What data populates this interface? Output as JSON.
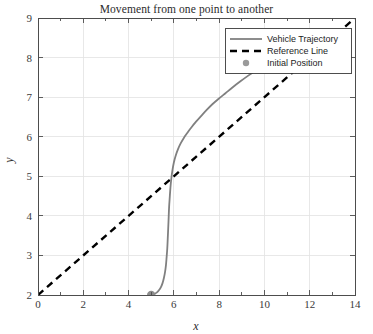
{
  "chart_data": {
    "type": "line",
    "title": "Movement from one point to another",
    "xlabel": "x",
    "ylabel": "y",
    "xlim": [
      0,
      14
    ],
    "ylim": [
      2,
      9
    ],
    "xticks": [
      0,
      2,
      4,
      6,
      8,
      10,
      12,
      14
    ],
    "xtick_labels": [
      "0",
      "2",
      "4",
      "6",
      "8",
      "10",
      "12",
      "14"
    ],
    "xminorticks": [
      1,
      3,
      5,
      7,
      9,
      11,
      13
    ],
    "yticks": [
      2,
      3,
      4,
      5,
      6,
      7,
      8,
      9
    ],
    "ytick_labels": [
      "2",
      "3",
      "4",
      "5",
      "6",
      "7",
      "8",
      "9"
    ],
    "grid": true,
    "legend_position": "top-right",
    "series": [
      {
        "name": "Vehicle Trajectory",
        "style": "solid",
        "color": "#808080",
        "points": [
          [
            5.0,
            2.0
          ],
          [
            5.12,
            2.02
          ],
          [
            5.24,
            2.06
          ],
          [
            5.34,
            2.12
          ],
          [
            5.43,
            2.2
          ],
          [
            5.5,
            2.3
          ],
          [
            5.56,
            2.43
          ],
          [
            5.61,
            2.58
          ],
          [
            5.65,
            2.75
          ],
          [
            5.68,
            2.95
          ],
          [
            5.71,
            3.18
          ],
          [
            5.73,
            3.42
          ],
          [
            5.75,
            3.68
          ],
          [
            5.77,
            3.95
          ],
          [
            5.79,
            4.22
          ],
          [
            5.82,
            4.48
          ],
          [
            5.85,
            4.72
          ],
          [
            5.89,
            4.95
          ],
          [
            5.94,
            5.16
          ],
          [
            6.0,
            5.35
          ],
          [
            6.08,
            5.52
          ],
          [
            6.18,
            5.68
          ],
          [
            6.3,
            5.83
          ],
          [
            6.44,
            5.97
          ],
          [
            6.6,
            6.1
          ],
          [
            6.78,
            6.24
          ],
          [
            6.98,
            6.38
          ],
          [
            7.2,
            6.52
          ],
          [
            7.44,
            6.67
          ],
          [
            7.7,
            6.82
          ],
          [
            7.98,
            6.96
          ],
          [
            8.28,
            7.1
          ],
          [
            8.6,
            7.25
          ],
          [
            8.94,
            7.4
          ],
          [
            9.3,
            7.55
          ],
          [
            9.68,
            7.7
          ],
          [
            10.08,
            7.86
          ],
          [
            10.5,
            8.02
          ],
          [
            10.94,
            8.19
          ],
          [
            11.4,
            8.37
          ],
          [
            11.55,
            8.43
          ]
        ]
      },
      {
        "name": "Reference Line",
        "style": "dashed",
        "color": "#000000",
        "points": [
          [
            0,
            2
          ],
          [
            14,
            9
          ]
        ]
      },
      {
        "name": "Initial Position",
        "style": "marker",
        "color": "#8c8c8c",
        "points": [
          [
            5.0,
            2.0
          ]
        ]
      }
    ]
  },
  "legend": {
    "items": [
      {
        "label": "Vehicle Trajectory",
        "glyph": "solid-line-swatch"
      },
      {
        "label": "Reference Line",
        "glyph": "dashed-line-swatch"
      },
      {
        "label": "Initial Position",
        "glyph": "circle-marker-swatch"
      }
    ]
  },
  "colors": {
    "trajectory": "#808080",
    "reference": "#000000",
    "marker": "#8c8c8c",
    "grid": "#e2e2e2",
    "axis": "#4d4d4d",
    "text": "#2b2b2b"
  }
}
